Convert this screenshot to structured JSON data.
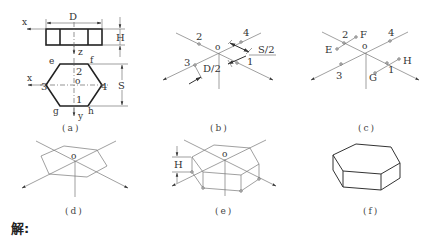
{
  "figures": {
    "a": {
      "caption": "(a)",
      "labels": {
        "D": "D",
        "H": "H",
        "S": "S",
        "x_top": "x",
        "z": "z",
        "x_bottom": "x",
        "y": "y",
        "o": "o",
        "e": "e",
        "f": "f",
        "g": "g",
        "h": "h",
        "p1": "1",
        "p2": "2",
        "p3": "3",
        "p4": "4"
      }
    },
    "b": {
      "caption": "(b)",
      "labels": {
        "o": "o",
        "p1": "1",
        "p2": "2",
        "p3": "3",
        "p4": "4",
        "S_half": "S/2",
        "D_half": "D/2"
      }
    },
    "c": {
      "caption": "(c)",
      "labels": {
        "o": "o",
        "p1": "1",
        "p2": "2",
        "p3": "3",
        "p4": "4",
        "E": "E",
        "F": "F",
        "G": "G",
        "H": "H"
      }
    },
    "d": {
      "caption": "(d)",
      "labels": {
        "o": "o"
      }
    },
    "e": {
      "caption": "(e)",
      "labels": {
        "o": "o",
        "H": "H"
      }
    },
    "f": {
      "caption": "(f)"
    }
  },
  "solution_label": "解:"
}
